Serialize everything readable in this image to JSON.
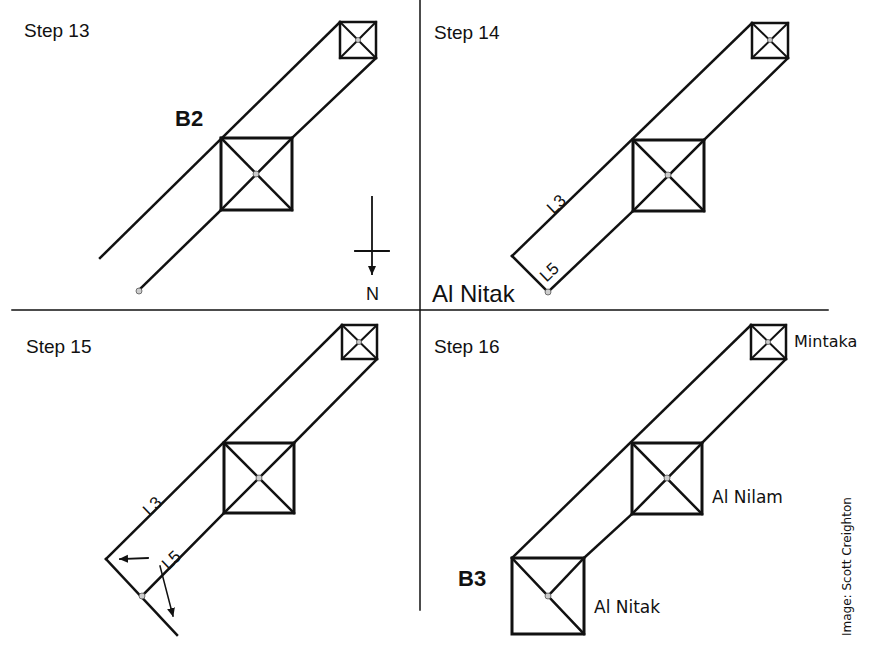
{
  "panels": [
    {
      "id": "step13",
      "title": "Step 13",
      "labels": {
        "bold": "B2",
        "compass": "N"
      }
    },
    {
      "id": "step14",
      "title": "Step 14",
      "labels": {
        "line_a": "L3",
        "line_b": "L5",
        "bottom": "Al Nitak"
      }
    },
    {
      "id": "step15",
      "title": "Step 15",
      "labels": {
        "line_a": "L3",
        "line_b": "L5"
      }
    },
    {
      "id": "step16",
      "title": "Step 16",
      "labels": {
        "bold": "B3",
        "star_top": "Mintaka",
        "star_middle": "Al Nilam",
        "star_bottom": "Al Nitak"
      }
    }
  ],
  "credit": "Image: Scott Creighton",
  "colors": {
    "ink": "#111111",
    "dot_fill": "#cccccc",
    "background": "#ffffff"
  }
}
